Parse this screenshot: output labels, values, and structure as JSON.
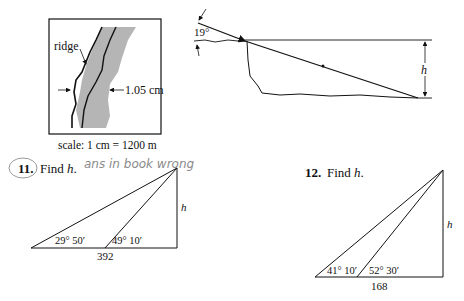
{
  "figure_map": {
    "label_ridge": "ridge",
    "label_width": "1.05 cm",
    "scale_caption": "scale: 1 cm = 1200 m"
  },
  "figure_slope": {
    "angle_label": "19°",
    "height_label": "h"
  },
  "problem_11": {
    "number": "11.",
    "prompt_find": "Find",
    "prompt_var": "h",
    "prompt_end": ".",
    "handwritten_note": "ans in book wrong",
    "angle_left": "29° 50′",
    "angle_right": "49° 10′",
    "base_label": "392",
    "height_label": "h"
  },
  "problem_12": {
    "number": "12.",
    "prompt_find": "Find",
    "prompt_var": "h",
    "prompt_end": ".",
    "angle_left": "41° 10′",
    "angle_right": "52° 30′",
    "base_label": "168",
    "height_label": "h"
  }
}
